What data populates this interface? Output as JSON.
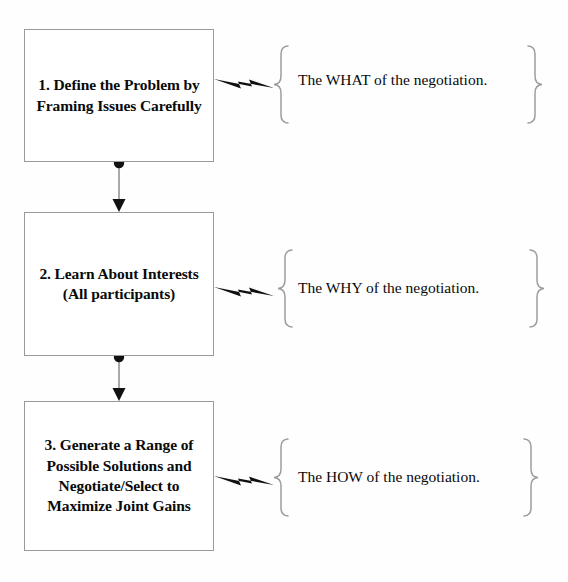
{
  "diagram": {
    "background_color": "#fefefe",
    "box_border_color": "#9a9a9a",
    "text_color": "#0a0a0a",
    "steps": [
      {
        "number": "1",
        "label": "1. Define the Problem by Framing Issues Carefully",
        "callout": "The WHAT of the negotiation."
      },
      {
        "number": "2",
        "label": "2. Learn About Interests (All participants)",
        "callout": "The WHY of the negotiation."
      },
      {
        "number": "3",
        "label": "3. Generate a Range of Possible Solutions and Negotiate/Select to Maximize Joint Gains",
        "callout": "The HOW of the negotiation."
      }
    ],
    "connectors": [
      {
        "from": "1",
        "to": "2",
        "start_marker": "filled-circle",
        "end_marker": "arrowhead"
      },
      {
        "from": "2",
        "to": "3",
        "start_marker": "filled-circle",
        "end_marker": "arrowhead"
      }
    ]
  }
}
